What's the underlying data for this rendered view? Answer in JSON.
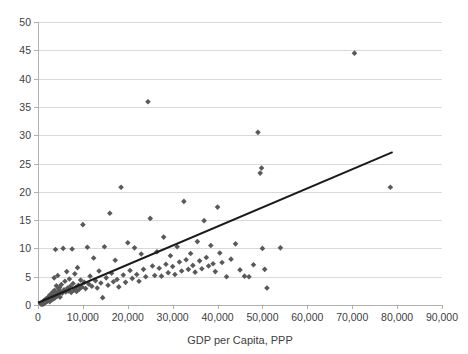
{
  "chart_data": {
    "type": "scatter",
    "title": "",
    "xlabel": "GDP per Capita, PPP",
    "ylabel": "",
    "xlim": [
      0,
      90000
    ],
    "ylim": [
      0,
      50
    ],
    "grid": "horizontal",
    "legend": "none",
    "xticks": [
      "0",
      "10,000",
      "20,000",
      "30,000",
      "40,000",
      "50,000",
      "60,000",
      "70,000",
      "80,000",
      "90,000"
    ],
    "xtick_values": [
      0,
      10000,
      20000,
      30000,
      40000,
      50000,
      60000,
      70000,
      80000,
      90000
    ],
    "yticks": [
      "0",
      "5",
      "10",
      "15",
      "20",
      "25",
      "30",
      "35",
      "40",
      "45",
      "50"
    ],
    "ytick_values": [
      0,
      5,
      10,
      15,
      20,
      25,
      30,
      35,
      40,
      45,
      50
    ],
    "marker_color": "#595959",
    "marker_shape": "diamond",
    "trendline_color": "#1a1a1a",
    "gridline_color": "#d9d9d9",
    "trendline": {
      "x0": 0,
      "y0": 0.4,
      "x1": 79000,
      "y1": 27.0
    },
    "points": [
      [
        600,
        0.2
      ],
      [
        800,
        0.3
      ],
      [
        900,
        0.1
      ],
      [
        1000,
        0.5
      ],
      [
        1100,
        0.3
      ],
      [
        1200,
        0.6
      ],
      [
        1300,
        0.2
      ],
      [
        1400,
        0.8
      ],
      [
        1500,
        0.4
      ],
      [
        1600,
        0.9
      ],
      [
        1700,
        0.5
      ],
      [
        1800,
        1.1
      ],
      [
        1900,
        0.6
      ],
      [
        2000,
        1.0
      ],
      [
        2100,
        0.7
      ],
      [
        2200,
        1.3
      ],
      [
        2300,
        0.8
      ],
      [
        2400,
        1.5
      ],
      [
        2500,
        1.0
      ],
      [
        2600,
        0.6
      ],
      [
        2700,
        1.8
      ],
      [
        2800,
        1.2
      ],
      [
        2900,
        0.9
      ],
      [
        3000,
        2.0
      ],
      [
        3100,
        1.4
      ],
      [
        3200,
        1.0
      ],
      [
        3300,
        2.3
      ],
      [
        3400,
        1.6
      ],
      [
        3500,
        1.1
      ],
      [
        3600,
        4.8
      ],
      [
        3700,
        2.6
      ],
      [
        3800,
        1.3
      ],
      [
        3900,
        9.8
      ],
      [
        4000,
        1.9
      ],
      [
        4100,
        3.4
      ],
      [
        4200,
        1.5
      ],
      [
        4300,
        2.2
      ],
      [
        4400,
        5.2
      ],
      [
        4500,
        1.7
      ],
      [
        4600,
        2.9
      ],
      [
        4700,
        2.0
      ],
      [
        4800,
        3.1
      ],
      [
        4900,
        1.4
      ],
      [
        5000,
        2.4
      ],
      [
        5200,
        3.6
      ],
      [
        5400,
        2.1
      ],
      [
        5600,
        10.0
      ],
      [
        5800,
        2.7
      ],
      [
        6000,
        4.2
      ],
      [
        6200,
        2.3
      ],
      [
        6400,
        5.9
      ],
      [
        6600,
        3.0
      ],
      [
        6800,
        2.5
      ],
      [
        7000,
        4.6
      ],
      [
        7200,
        3.3
      ],
      [
        7400,
        2.2
      ],
      [
        7600,
        9.9
      ],
      [
        7800,
        3.8
      ],
      [
        8000,
        2.6
      ],
      [
        8200,
        5.5
      ],
      [
        8400,
        3.1
      ],
      [
        8600,
        2.4
      ],
      [
        8800,
        6.6
      ],
      [
        9000,
        3.5
      ],
      [
        9200,
        2.8
      ],
      [
        9500,
        4.4
      ],
      [
        9800,
        3.2
      ],
      [
        10000,
        14.2
      ],
      [
        10300,
        4.0
      ],
      [
        10600,
        2.9
      ],
      [
        11000,
        10.2
      ],
      [
        11300,
        3.7
      ],
      [
        11600,
        5.1
      ],
      [
        12000,
        3.3
      ],
      [
        12400,
        8.3
      ],
      [
        12800,
        4.3
      ],
      [
        13200,
        3.0
      ],
      [
        13600,
        6.0
      ],
      [
        14000,
        3.9
      ],
      [
        14400,
        1.3
      ],
      [
        14800,
        10.3
      ],
      [
        15200,
        4.8
      ],
      [
        15600,
        3.5
      ],
      [
        16000,
        16.2
      ],
      [
        16400,
        5.6
      ],
      [
        16800,
        4.1
      ],
      [
        17200,
        7.9
      ],
      [
        17600,
        4.5
      ],
      [
        18000,
        3.2
      ],
      [
        18500,
        20.8
      ],
      [
        19000,
        5.3
      ],
      [
        19500,
        4.0
      ],
      [
        20000,
        11.0
      ],
      [
        20500,
        6.1
      ],
      [
        21000,
        4.7
      ],
      [
        21500,
        10.1
      ],
      [
        22000,
        5.4
      ],
      [
        22500,
        4.2
      ],
      [
        23000,
        9.0
      ],
      [
        23500,
        6.3
      ],
      [
        24000,
        5.0
      ],
      [
        24500,
        35.9
      ],
      [
        25000,
        15.3
      ],
      [
        25500,
        6.9
      ],
      [
        26000,
        5.2
      ],
      [
        26500,
        9.4
      ],
      [
        27000,
        6.5
      ],
      [
        27500,
        5.1
      ],
      [
        28000,
        12.0
      ],
      [
        28500,
        7.2
      ],
      [
        29000,
        5.7
      ],
      [
        29500,
        8.7
      ],
      [
        30000,
        6.8
      ],
      [
        30500,
        5.4
      ],
      [
        31000,
        10.3
      ],
      [
        31500,
        7.6
      ],
      [
        32000,
        6.0
      ],
      [
        32500,
        18.3
      ],
      [
        33000,
        8.0
      ],
      [
        33500,
        6.3
      ],
      [
        34000,
        9.1
      ],
      [
        34500,
        7.0
      ],
      [
        35000,
        5.8
      ],
      [
        35500,
        11.2
      ],
      [
        36000,
        7.8
      ],
      [
        36500,
        6.4
      ],
      [
        37000,
        14.9
      ],
      [
        37500,
        8.4
      ],
      [
        38000,
        6.9
      ],
      [
        38500,
        10.5
      ],
      [
        39000,
        7.3
      ],
      [
        39500,
        5.9
      ],
      [
        40000,
        17.3
      ],
      [
        40500,
        9.2
      ],
      [
        41000,
        7.5
      ],
      [
        42000,
        5.0
      ],
      [
        43000,
        8.1
      ],
      [
        44000,
        10.8
      ],
      [
        45000,
        6.2
      ],
      [
        46000,
        5.1
      ],
      [
        47000,
        5.0
      ],
      [
        48000,
        7.1
      ],
      [
        49000,
        30.5
      ],
      [
        49500,
        23.3
      ],
      [
        49800,
        24.2
      ],
      [
        50000,
        10.0
      ],
      [
        50500,
        6.3
      ],
      [
        51000,
        3.0
      ],
      [
        54000,
        10.1
      ],
      [
        70500,
        44.5
      ],
      [
        78500,
        20.8
      ]
    ]
  },
  "layout": {
    "plot_left": 38,
    "plot_right": 442,
    "plot_top": 22,
    "plot_bottom": 305
  }
}
